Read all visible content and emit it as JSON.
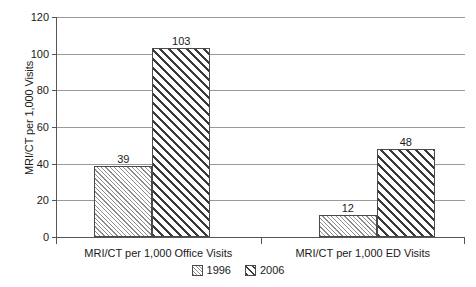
{
  "chart_data": {
    "type": "bar",
    "title": "",
    "xlabel": "",
    "ylabel": "MRI/CT per 1,000 Visits",
    "ylim": [
      0,
      120
    ],
    "yticks": [
      0,
      20,
      40,
      60,
      80,
      100,
      120
    ],
    "ytick_labels": [
      "0",
      "20",
      "40",
      "60",
      "80",
      "100",
      "120"
    ],
    "grid": true,
    "legend_position": "bottom-center",
    "categories": [
      "MRI/CT per 1,000 Office Visits",
      "MRI/CT per 1,000 ED Visits"
    ],
    "series": [
      {
        "name": "1996",
        "values": [
          39,
          12
        ],
        "value_labels": [
          "39",
          "12"
        ],
        "pattern": "fine-diagonal-hatch",
        "pattern_color": "#8d8d8d",
        "fill": "#ffffff",
        "border": "#4a4a4a"
      },
      {
        "name": "2006",
        "values": [
          103,
          48
        ],
        "value_labels": [
          "103",
          "48"
        ],
        "pattern": "bold-diagonal-hatch",
        "pattern_color": "#3a3a3a",
        "fill": "#ffffff",
        "border": "#4a4a4a"
      }
    ],
    "legend": [
      "1996",
      "2006"
    ],
    "axis_color": "#555555",
    "gridline_color": "#9a9a9a",
    "background": "#ffffff",
    "text_color": "#1a1a1a"
  }
}
